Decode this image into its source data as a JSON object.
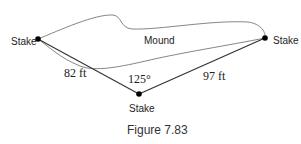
{
  "figure": {
    "caption": "Figure 7.83",
    "region_label": "Mound",
    "points": {
      "left": {
        "label": "Stake"
      },
      "right": {
        "label": "Stake"
      },
      "bottom": {
        "label": "Stake"
      }
    },
    "segments": {
      "left_to_bottom": "82 ft",
      "bottom_to_right": "97 ft"
    },
    "angle": "125°"
  }
}
